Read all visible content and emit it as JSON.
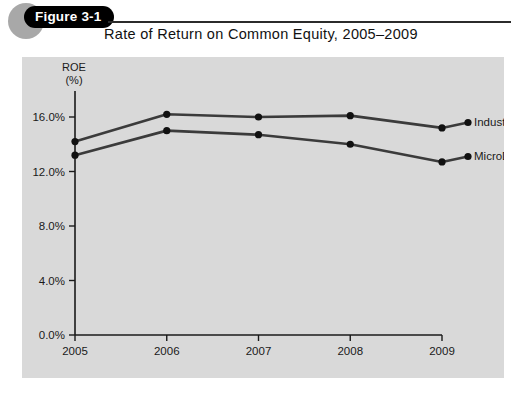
{
  "figure": {
    "badge_label": "Figure 3-1",
    "title": "Rate of Return on Common Equity, 2005–2009"
  },
  "colors": {
    "panel_background": "#d9d9d9",
    "page_background": "#ffffff",
    "badge_fill": "#000000",
    "badge_circle": "#a8a8a8",
    "axis": "#1a1a1a",
    "series_industry": "#3b3b3b",
    "series_microdrive": "#3b3b3b",
    "text": "#111111"
  },
  "chart_data": {
    "type": "line",
    "title": "Rate of Return on Common Equity, 2005–2009",
    "xlabel": "",
    "ylabel": "ROE (%)",
    "ylabel_line1": "ROE",
    "ylabel_line2": "(%)",
    "x": [
      "2005",
      "2006",
      "2007",
      "2008",
      "2009"
    ],
    "categories": [
      "2005",
      "2006",
      "2007",
      "2008",
      "2009"
    ],
    "xticklabels": [
      "2005",
      "2006",
      "2007",
      "2008",
      "2009"
    ],
    "yticklabels": [
      "0.0%",
      "4.0%",
      "8.0%",
      "12.0%",
      "16.0%"
    ],
    "ytickvalues": [
      0.0,
      4.0,
      8.0,
      12.0,
      16.0
    ],
    "ylim": [
      0.0,
      16.0
    ],
    "grid": false,
    "legend_position": "right-inline-labels",
    "series": [
      {
        "name": "Industry",
        "values": [
          14.2,
          16.2,
          16.0,
          16.1,
          15.2
        ],
        "marker": "circle",
        "color": "#3b3b3b"
      },
      {
        "name": "MicroDrive",
        "values": [
          13.2,
          15.0,
          14.7,
          14.0,
          12.7
        ],
        "marker": "circle",
        "color": "#3b3b3b"
      }
    ],
    "legend_entries": [
      "Industry",
      "MicroDrive"
    ]
  }
}
